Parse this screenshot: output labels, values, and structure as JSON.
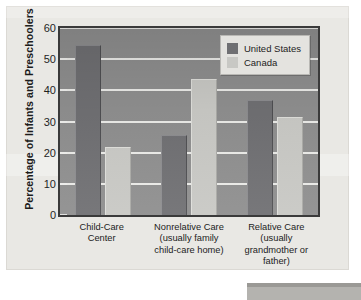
{
  "chart_data": {
    "type": "bar",
    "title": "",
    "subtitle": "",
    "xlabel": "",
    "ylabel": "Percentage of Infants and Preschoolers",
    "ylim": [
      0,
      60
    ],
    "yticks": [
      0,
      10,
      20,
      30,
      40,
      50,
      60
    ],
    "ytick_labels": [
      "0",
      "10",
      "20",
      "30",
      "40",
      "50",
      "60"
    ],
    "grid": true,
    "grid_axis": "y",
    "legend_position": "top-right",
    "categories": [
      "Child-Care\nCenter",
      "Nonrelative Care\n(usually family\nchild-care home)",
      "Relative Care\n(usually\ngrandmother or\nfather)"
    ],
    "series": [
      {
        "name": "United States",
        "color": "#6f6f72",
        "values": [
          54.5,
          25.7,
          37.0
        ]
      },
      {
        "name": "Canada",
        "color": "#c8c8c4",
        "values": [
          21.8,
          43.8,
          31.5
        ]
      }
    ],
    "annotations": []
  },
  "axis": {
    "y_title": "Percentage of Infants and Preschoolers",
    "y_tick_labels": [
      "60",
      "50",
      "40",
      "30",
      "20",
      "10",
      "0"
    ]
  },
  "legend": {
    "items": [
      {
        "label": "United States",
        "swatch": "#6f6f72"
      },
      {
        "label": "Canada",
        "swatch": "#c8c8c4"
      }
    ]
  },
  "x_axis": {
    "labels": [
      [
        "Child-Care",
        "Center"
      ],
      [
        "Nonrelative Care",
        "(usually family",
        "child-care home)"
      ],
      [
        "Relative Care",
        "(usually",
        "grandmother or",
        "father)"
      ]
    ]
  },
  "colors": {
    "plot_background": "#8e8e8e",
    "panel_background": "#e9e8e4",
    "gridline": "#f2f2ef",
    "plot_border": "#3a3a3a",
    "text": "#1c1c1c"
  }
}
